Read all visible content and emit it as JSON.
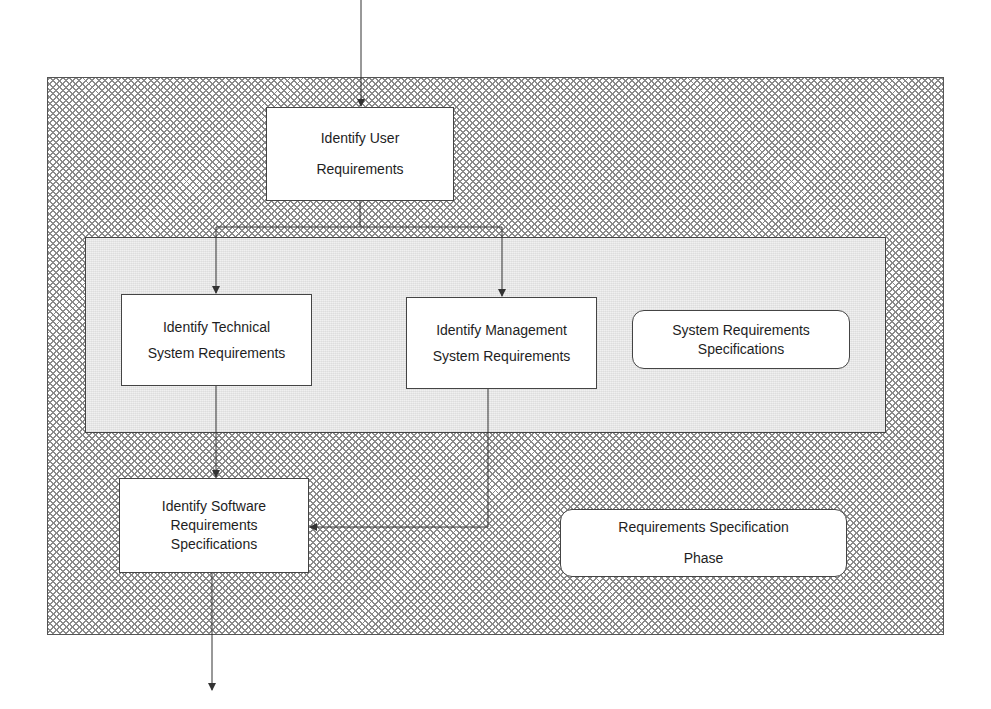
{
  "diagram": {
    "title": "Requirements Specification Phase",
    "outer_frame": {
      "label_lines": [
        "Requirements Specification",
        "Phase"
      ],
      "fill": "crosshatch"
    },
    "inner_panel": {
      "label_lines": [
        "System Requirements",
        "Specifications"
      ],
      "fill": "light-gray"
    },
    "nodes": {
      "user_req": {
        "lines": [
          "Identify  User",
          "Requirements"
        ]
      },
      "technical_req": {
        "lines": [
          "Identify Technical",
          "System Requirements"
        ]
      },
      "management_req": {
        "lines": [
          "Identify Management",
          "System Requirements"
        ]
      },
      "software_req": {
        "lines": [
          "Identify Software",
          "Requirements",
          "Specifications"
        ]
      }
    },
    "edges": [
      {
        "from": "external-input",
        "to": "user_req"
      },
      {
        "from": "user_req",
        "to": "technical_req"
      },
      {
        "from": "user_req",
        "to": "management_req"
      },
      {
        "from": "technical_req",
        "to": "software_req"
      },
      {
        "from": "management_req",
        "to": "software_req"
      },
      {
        "from": "software_req",
        "to": "external-output"
      }
    ],
    "colors": {
      "line": "#333333",
      "box_fill": "#ffffff",
      "panel_fill": "#e9e9e9",
      "hatch": "#8a8a8a"
    }
  }
}
